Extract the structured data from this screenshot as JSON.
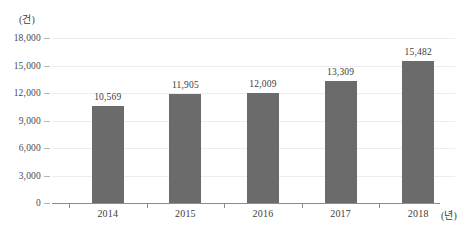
{
  "chart_data": {
    "type": "bar",
    "title": "",
    "subtitle": "",
    "xlabel": "(년)",
    "ylabel": "(건)",
    "categories": [
      "2014",
      "2015",
      "2016",
      "2017",
      "2018"
    ],
    "values": [
      10569,
      11905,
      12009,
      13309,
      15482
    ],
    "value_labels": [
      "10,569",
      "11,905",
      "12,009",
      "13,309",
      "15,482"
    ],
    "series": [
      {
        "name": "",
        "values": [
          10569,
          11905,
          12009,
          13309,
          15482
        ]
      }
    ],
    "ylim": [
      0,
      18000
    ],
    "y_ticks": [
      0,
      3000,
      6000,
      9000,
      12000,
      15000,
      18000
    ],
    "y_tick_labels": [
      "0",
      "3,000",
      "6,000",
      "9,000",
      "12,000",
      "15,000",
      "18,000"
    ],
    "grid": true,
    "legend": false,
    "legend_position": "none",
    "bar_color": "#6b6b6b",
    "gridline_color": "#ececed",
    "axis_color": "#8d8d8d",
    "background_color": "#ffffff"
  }
}
